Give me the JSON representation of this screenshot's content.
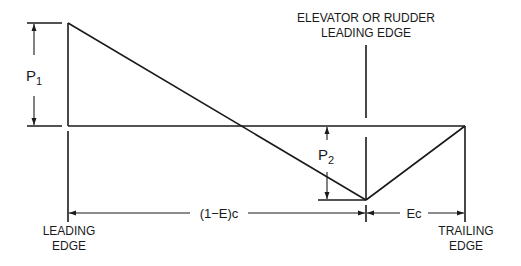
{
  "diagram": {
    "labels": {
      "elevator_line1": "ELEVATOR OR RUDDER",
      "elevator_line2": "LEADING EDGE",
      "p1": "P",
      "p1_sub": "1",
      "p2": "P",
      "p2_sub": "2",
      "dim_left": "(1−E)c",
      "dim_right": "Ec",
      "leading_edge_line1": "LEADING",
      "leading_edge_line2": "EDGE",
      "trailing_edge_line1": "TRAILING",
      "trailing_edge_line2": "EDGE"
    },
    "colors": {
      "ink": "#1a1a1a",
      "background": "#ffffff"
    }
  }
}
